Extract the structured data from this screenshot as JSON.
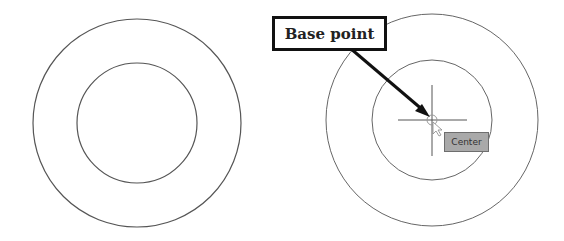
{
  "diagram": {
    "left_figure": {
      "outer_circle": {
        "cx": 137,
        "cy": 123,
        "r": 104
      },
      "inner_circle": {
        "cx": 137,
        "cy": 123,
        "r": 60
      }
    },
    "right_figure": {
      "outer_circle": {
        "cx": 432,
        "cy": 120,
        "r": 106
      },
      "inner_circle": {
        "cx": 432,
        "cy": 120,
        "r": 60
      },
      "crosshair": {
        "cx": 432,
        "cy": 120
      }
    },
    "callout": {
      "label": "Base point"
    },
    "tooltip": {
      "label": "Center"
    },
    "colors": {
      "stroke": "#555555",
      "arrow": "#111111",
      "tooltip_fill": "#a9a9a9"
    }
  }
}
